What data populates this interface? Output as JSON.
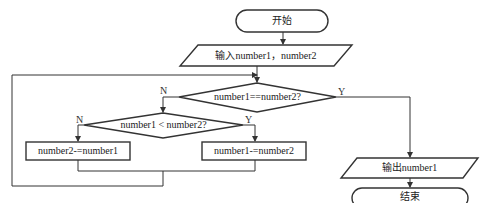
{
  "diagram": {
    "type": "flowchart",
    "nodes": {
      "start": {
        "shape": "terminator",
        "label": "开始"
      },
      "input": {
        "shape": "parallelogram",
        "label": "输入number1，number2"
      },
      "cond_equal": {
        "shape": "diamond",
        "label": "number1==number2?"
      },
      "cond_less": {
        "shape": "diamond",
        "label": "number1 < number2?"
      },
      "proc_sub2": {
        "shape": "rectangle",
        "label": "number2-=number1"
      },
      "proc_sub1": {
        "shape": "rectangle",
        "label": "number1-=number2"
      },
      "output": {
        "shape": "parallelogram",
        "label": "输出number1"
      },
      "end": {
        "shape": "terminator",
        "label": "结束"
      }
    },
    "edge_labels": {
      "equal_yes": "Y",
      "equal_no": "N",
      "less_yes": "Y",
      "less_no": "N"
    },
    "edges": [
      {
        "from": "start",
        "to": "input"
      },
      {
        "from": "input",
        "to": "cond_equal"
      },
      {
        "from": "cond_equal",
        "to": "output",
        "label": "Y"
      },
      {
        "from": "cond_equal",
        "to": "cond_less",
        "label": "N"
      },
      {
        "from": "cond_less",
        "to": "proc_sub2",
        "label": "N"
      },
      {
        "from": "cond_less",
        "to": "proc_sub1",
        "label": "Y"
      },
      {
        "from": "proc_sub2",
        "to": "cond_equal",
        "label": "loop"
      },
      {
        "from": "proc_sub1",
        "to": "cond_equal",
        "label": "loop"
      },
      {
        "from": "output",
        "to": "end"
      }
    ],
    "colors": {
      "stroke": "#333333",
      "background": "#ffffff",
      "text": "#222222"
    }
  }
}
